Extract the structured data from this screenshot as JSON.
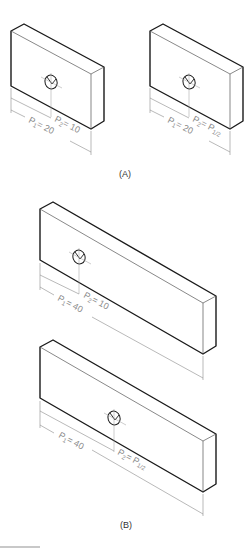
{
  "figure": {
    "panels": [
      {
        "id": "A",
        "label": "(A)",
        "parts": [
          {
            "name": "plate-a-left",
            "p1_label": "P",
            "p1_sub": "1",
            "p1_value": "= 20",
            "p2_label": "P",
            "p2_sub": "2",
            "p2_value": "= 10"
          },
          {
            "name": "plate-a-right",
            "p1_label": "P",
            "p1_sub": "1",
            "p1_value": "= 20",
            "p2_label": "P",
            "p2_sub": "2",
            "p2_value": "= P",
            "p2_value_sub": "1/2"
          }
        ]
      },
      {
        "id": "B",
        "label": "(B)",
        "parts": [
          {
            "name": "plate-b-top",
            "p1_label": "P",
            "p1_sub": "1",
            "p1_value": "= 40",
            "p2_label": "P",
            "p2_sub": "2",
            "p2_value": "= 10"
          },
          {
            "name": "plate-b-bottom",
            "p1_label": "P",
            "p1_sub": "1",
            "p1_value": "= 40",
            "p2_label": "P",
            "p2_sub": "2",
            "p2_value": "= P",
            "p2_value_sub": "1/2"
          }
        ]
      }
    ]
  },
  "colors": {
    "edge": "#1a1a1a",
    "dimension": "#8a8a8a",
    "background": "#ffffff"
  }
}
